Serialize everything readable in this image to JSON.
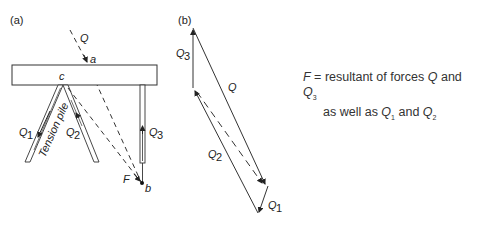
{
  "diagram": {
    "panel_a": {
      "label": "(a)",
      "labels": {
        "Q": "Q",
        "a": "a",
        "c": "c",
        "b": "b",
        "F": "F",
        "Q1": "Q",
        "Q1_sub": "1",
        "Q2": "Q",
        "Q2_sub": "2",
        "Q3": "Q",
        "Q3_sub": "3",
        "tension_pile": "Tension pile"
      }
    },
    "panel_b": {
      "label": "(b)",
      "labels": {
        "Q": "Q",
        "Q1": "Q",
        "Q1_sub": "1",
        "Q2": "Q",
        "Q2_sub": "2",
        "Q3": "Q",
        "Q3_sub": "3"
      }
    },
    "note": {
      "F": "F",
      "line1": " = resultant of forces ",
      "Q": "Q",
      "and": " and ",
      "Q3": "Q",
      "Q3_sub": "3",
      "line2_start": "as well as ",
      "Q1": "Q",
      "Q1_sub": "1",
      "and2": " and ",
      "Q2": "Q",
      "Q2_sub": "2"
    },
    "colors": {
      "line": "#333333",
      "text": "#222222"
    }
  }
}
